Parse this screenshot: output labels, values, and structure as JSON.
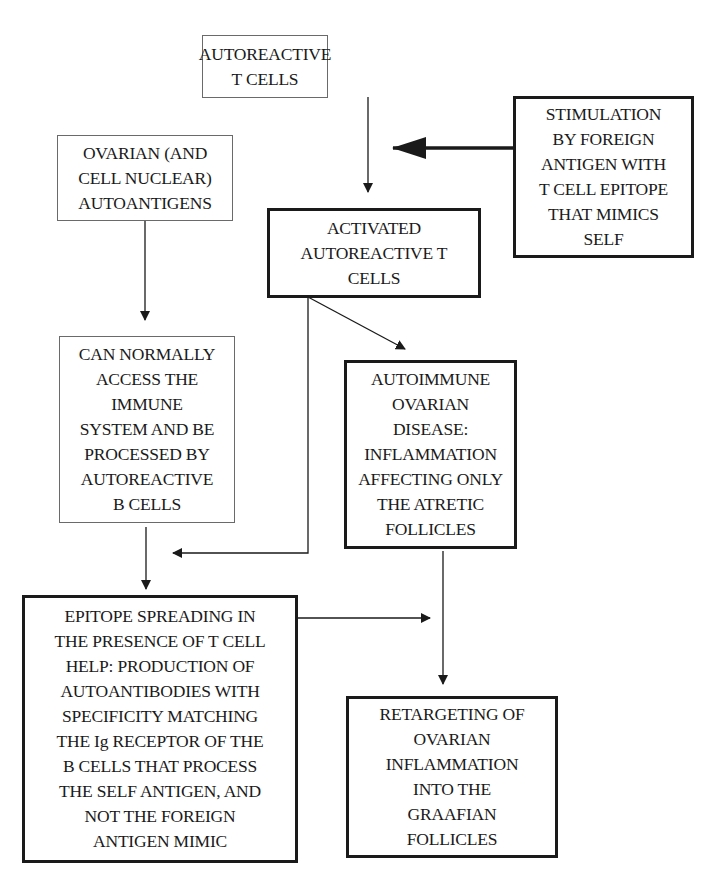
{
  "diagram": {
    "type": "flowchart",
    "nodes": [
      {
        "id": "autoreactive_t_cells",
        "lines": [
          "AUTOREACTIVE",
          "T CELLS"
        ],
        "border": "thin"
      },
      {
        "id": "stimulation",
        "lines": [
          "STIMULATION",
          "BY FOREIGN",
          "ANTIGEN WITH",
          "T CELL EPITOPE",
          "THAT MIMICS",
          "SELF"
        ],
        "border": "thick"
      },
      {
        "id": "ovarian_autoantigens",
        "lines": [
          "OVARIAN (AND",
          "CELL NUCLEAR)",
          "AUTOANTIGENS"
        ],
        "border": "thin"
      },
      {
        "id": "activated_t_cells",
        "lines": [
          "ACTIVATED",
          "AUTOREACTIVE T",
          "CELLS"
        ],
        "border": "thick"
      },
      {
        "id": "access_immune_system",
        "lines": [
          "CAN NORMALLY",
          "ACCESS THE",
          "IMMUNE",
          "SYSTEM AND BE",
          "PROCESSED BY",
          "AUTOREACTIVE",
          "B CELLS"
        ],
        "border": "thin"
      },
      {
        "id": "autoimmune_disease",
        "lines": [
          "AUTOIMMUNE",
          "OVARIAN",
          "DISEASE:",
          "INFLAMMATION",
          "AFFECTING ONLY",
          "THE ATRETIC",
          "FOLLICLES"
        ],
        "border": "thick"
      },
      {
        "id": "epitope_spreading",
        "lines": [
          "EPITOPE SPREADING IN",
          "THE PRESENCE OF T CELL",
          "HELP: PRODUCTION OF",
          "AUTOANTIBODIES WITH",
          "SPECIFICITY MATCHING",
          "THE Ig RECEPTOR OF THE",
          "B CELLS THAT PROCESS",
          "THE SELF ANTIGEN, AND",
          "NOT THE FOREIGN",
          "ANTIGEN MIMIC"
        ],
        "border": "thick"
      },
      {
        "id": "retargeting",
        "lines": [
          "RETARGETING OF",
          "OVARIAN",
          "INFLAMMATION",
          "INTO THE",
          "GRAAFIAN",
          "FOLLICLES"
        ],
        "border": "thick"
      }
    ],
    "edges": [
      {
        "from": "autoreactive_t_cells",
        "to": "activated_t_cells"
      },
      {
        "from": "stimulation",
        "to": "activated_t_cells",
        "style": "bold"
      },
      {
        "from": "ovarian_autoantigens",
        "to": "access_immune_system"
      },
      {
        "from": "activated_t_cells",
        "to": "autoimmune_disease"
      },
      {
        "from": "activated_t_cells",
        "to": "epitope_spreading"
      },
      {
        "from": "access_immune_system",
        "to": "epitope_spreading"
      },
      {
        "from": "autoimmune_disease",
        "to": "retargeting"
      },
      {
        "from": "epitope_spreading",
        "to": "retargeting"
      }
    ]
  }
}
